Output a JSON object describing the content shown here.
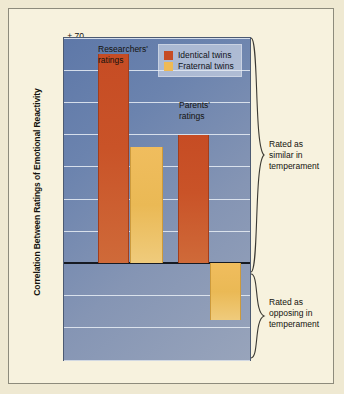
{
  "chart_data": {
    "type": "bar",
    "title": "",
    "xlabel": "",
    "ylabel": "Correlation Between Ratings of Emotional Reactivity",
    "ylim": [
      -0.3,
      0.7
    ],
    "yticks": [
      "+.70",
      "+.60",
      "+.50",
      "+.40",
      "+.30",
      "+.20",
      "+.10",
      "0",
      "-.10",
      "-.20",
      "-.30"
    ],
    "ytick_values": [
      0.7,
      0.6,
      0.5,
      0.4,
      0.3,
      0.2,
      0.1,
      0.0,
      -0.1,
      -0.2,
      -0.3
    ],
    "grid": true,
    "legend_position": "top-right",
    "categories": [
      "Researchers' ratings",
      "Parents' ratings"
    ],
    "series": [
      {
        "name": "Identical twins",
        "color": "#c64c24",
        "values": [
          0.65,
          0.4
        ]
      },
      {
        "name": "Fraternal twins",
        "color": "#eeba56",
        "values": [
          0.36,
          -0.175
        ]
      }
    ],
    "bars": [
      {
        "group": "Researchers' ratings",
        "series": "Identical twins",
        "value": 0.65
      },
      {
        "group": "Researchers' ratings",
        "series": "Fraternal twins",
        "value": 0.36
      },
      {
        "group": "Parents' ratings",
        "series": "Identical twins",
        "value": 0.4
      },
      {
        "group": "Parents' ratings",
        "series": "Fraternal twins",
        "value": -0.175
      }
    ],
    "annotations": [
      {
        "text_line1": "Rated as",
        "text_line2": "similar in",
        "text_line3": "temperament",
        "region": "positive"
      },
      {
        "text_line1": "Rated as",
        "text_line2": "opposing in",
        "text_line3": "temperament",
        "region": "negative"
      }
    ],
    "category_labels": [
      {
        "line1": "Researchers'",
        "line2": "ratings"
      },
      {
        "line1": "Parents'",
        "line2": "ratings"
      }
    ]
  },
  "legend": {
    "items": [
      {
        "label": "Identical twins"
      },
      {
        "label": "Fraternal twins"
      }
    ]
  },
  "axis": {
    "title": "Correlation Between Ratings of Emotional Reactivity",
    "ticks": [
      "+.70",
      "+.60",
      "+.50",
      "+.40",
      "+.30",
      "+.20",
      "+.10",
      "0",
      "-.10",
      "-.20",
      "-.30"
    ]
  },
  "annotations": {
    "top": {
      "line1": "Rated as",
      "line2": "similar in",
      "line3": "temperament"
    },
    "bottom": {
      "line1": "Rated as",
      "line2": "opposing in",
      "line3": "temperament"
    }
  },
  "category_labels": {
    "researchers": {
      "line1": "Researchers'",
      "line2": "ratings"
    },
    "parents": {
      "line1": "Parents'",
      "line2": "ratings"
    }
  },
  "colors": {
    "identical": "#c64c24",
    "fraternal": "#eeba56",
    "page_background": "#f7f2de",
    "plot_background": "#6b83ae"
  }
}
